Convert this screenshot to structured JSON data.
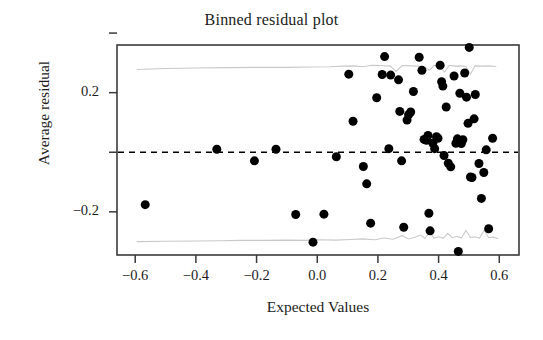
{
  "chart_data": {
    "type": "scatter",
    "title": "Binned residual plot",
    "xlabel": "Expected Values",
    "ylabel": "Average residual",
    "xlim": [
      -0.66,
      0.665
    ],
    "ylim": [
      -0.345,
      0.36
    ],
    "grid": false,
    "legend": null,
    "xticks": [
      -0.6,
      -0.4,
      -0.2,
      0.0,
      0.2,
      0.4,
      0.6
    ],
    "xticklabels": [
      "−0.6",
      "−0.4",
      "−0.2",
      "0.0",
      "0.2",
      "0.4",
      "0.6"
    ],
    "yticks": [
      0.4,
      0.2,
      0.0,
      -0.2
    ],
    "yticklabels": [
      "",
      "0.2",
      "",
      "−0.2"
    ],
    "reference_line": {
      "name": "zero-line",
      "y": 0.0,
      "style": "dashed",
      "color": "#000000"
    },
    "confidence_bands": {
      "name": "two-se-bands",
      "color": "#c9c9c9",
      "upper_mean": 0.285,
      "lower_mean": -0.295,
      "upper": [
        [
          -0.595,
          0.278
        ],
        [
          -0.5,
          0.281
        ],
        [
          -0.4,
          0.283
        ],
        [
          -0.3,
          0.284
        ],
        [
          -0.2,
          0.285
        ],
        [
          -0.1,
          0.285
        ],
        [
          -0.02,
          0.286
        ],
        [
          0.04,
          0.287
        ],
        [
          0.09,
          0.289
        ],
        [
          0.12,
          0.29
        ],
        [
          0.15,
          0.287
        ],
        [
          0.18,
          0.292
        ],
        [
          0.21,
          0.291
        ],
        [
          0.24,
          0.289
        ],
        [
          0.26,
          0.272
        ],
        [
          0.28,
          0.291
        ],
        [
          0.31,
          0.29
        ],
        [
          0.33,
          0.289
        ],
        [
          0.35,
          0.288
        ],
        [
          0.37,
          0.275
        ],
        [
          0.385,
          0.292
        ],
        [
          0.4,
          0.288
        ],
        [
          0.42,
          0.27
        ],
        [
          0.435,
          0.292
        ],
        [
          0.45,
          0.289
        ],
        [
          0.47,
          0.29
        ],
        [
          0.49,
          0.288
        ],
        [
          0.505,
          0.262
        ],
        [
          0.52,
          0.29
        ],
        [
          0.545,
          0.289
        ],
        [
          0.565,
          0.29
        ],
        [
          0.59,
          0.288
        ]
      ],
      "lower": [
        [
          -0.595,
          -0.3
        ],
        [
          -0.5,
          -0.299
        ],
        [
          -0.4,
          -0.298
        ],
        [
          -0.32,
          -0.297
        ],
        [
          -0.25,
          -0.296
        ],
        [
          -0.18,
          -0.296
        ],
        [
          -0.1,
          -0.295
        ],
        [
          -0.04,
          -0.296
        ],
        [
          0.01,
          -0.294
        ],
        [
          0.06,
          -0.295
        ],
        [
          0.11,
          -0.293
        ],
        [
          0.15,
          -0.291
        ],
        [
          0.19,
          -0.294
        ],
        [
          0.22,
          -0.288
        ],
        [
          0.25,
          -0.292
        ],
        [
          0.28,
          -0.28
        ],
        [
          0.3,
          -0.291
        ],
        [
          0.32,
          -0.286
        ],
        [
          0.34,
          -0.278
        ],
        [
          0.355,
          -0.289
        ],
        [
          0.37,
          -0.268
        ],
        [
          0.385,
          -0.288
        ],
        [
          0.4,
          -0.284
        ],
        [
          0.415,
          -0.289
        ],
        [
          0.43,
          -0.272
        ],
        [
          0.445,
          -0.287
        ],
        [
          0.46,
          -0.282
        ],
        [
          0.475,
          -0.288
        ],
        [
          0.49,
          -0.263
        ],
        [
          0.505,
          -0.286
        ],
        [
          0.52,
          -0.284
        ],
        [
          0.535,
          -0.288
        ],
        [
          0.55,
          -0.262
        ],
        [
          0.565,
          -0.287
        ],
        [
          0.58,
          -0.285
        ],
        [
          0.595,
          -0.29
        ]
      ]
    },
    "point_style": {
      "marker": "circle",
      "color": "#000000",
      "size_px": 9
    },
    "points": [
      [
        -0.567,
        -0.176
      ],
      [
        -0.331,
        0.01
      ],
      [
        -0.207,
        -0.029
      ],
      [
        -0.136,
        0.01
      ],
      [
        -0.071,
        -0.209
      ],
      [
        -0.014,
        -0.302
      ],
      [
        0.022,
        -0.208
      ],
      [
        0.063,
        -0.015
      ],
      [
        0.104,
        0.262
      ],
      [
        0.118,
        0.104
      ],
      [
        0.152,
        -0.048
      ],
      [
        0.163,
        -0.106
      ],
      [
        0.176,
        -0.238
      ],
      [
        0.196,
        0.183
      ],
      [
        0.214,
        0.261
      ],
      [
        0.222,
        0.321
      ],
      [
        0.236,
        0.012
      ],
      [
        0.242,
        0.259
      ],
      [
        0.268,
        0.243
      ],
      [
        0.272,
        0.137
      ],
      [
        0.278,
        -0.029
      ],
      [
        0.285,
        -0.252
      ],
      [
        0.296,
        0.108
      ],
      [
        0.301,
        0.126
      ],
      [
        0.308,
        0.135
      ],
      [
        0.317,
        0.204
      ],
      [
        0.336,
        0.319
      ],
      [
        0.345,
        0.275
      ],
      [
        0.352,
        0.043
      ],
      [
        0.36,
        0.04
      ],
      [
        0.365,
        0.056
      ],
      [
        0.368,
        -0.205
      ],
      [
        0.372,
        -0.264
      ],
      [
        0.381,
        0.03
      ],
      [
        0.387,
        0.012
      ],
      [
        0.393,
        0.052
      ],
      [
        0.398,
        0.047
      ],
      [
        0.405,
        0.292
      ],
      [
        0.41,
        0.237
      ],
      [
        0.414,
        0.222
      ],
      [
        0.418,
        -0.011
      ],
      [
        0.425,
        0.152
      ],
      [
        0.432,
        -0.037
      ],
      [
        0.44,
        -0.049
      ],
      [
        0.451,
        0.256
      ],
      [
        0.457,
        0.03
      ],
      [
        0.462,
        0.045
      ],
      [
        0.465,
        -0.333
      ],
      [
        0.47,
        0.198
      ],
      [
        0.475,
        0.029
      ],
      [
        0.48,
        0.042
      ],
      [
        0.486,
        0.266
      ],
      [
        0.492,
        0.185
      ],
      [
        0.497,
        0.097
      ],
      [
        0.501,
        0.352
      ],
      [
        0.505,
        -0.083
      ],
      [
        0.51,
        -0.085
      ],
      [
        0.517,
        0.112
      ],
      [
        0.521,
        0.194
      ],
      [
        0.533,
        -0.038
      ],
      [
        0.541,
        -0.155
      ],
      [
        0.549,
        -0.068
      ],
      [
        0.557,
        0.008
      ],
      [
        0.565,
        -0.257
      ],
      [
        0.578,
        0.047
      ]
    ]
  }
}
